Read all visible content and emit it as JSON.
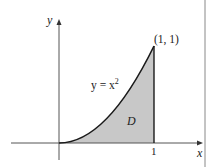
{
  "figure": {
    "curve_label_prefix": "y = x",
    "curve_label_exp": "2",
    "region_label": "D",
    "point_label": "(1, 1)",
    "x_axis_label": "x",
    "y_axis_label": "y",
    "x_tick_label": "1",
    "colors": {
      "region_fill": "#c8c8c8",
      "curve": "#1a1a1a",
      "axes": "#555555",
      "border": "#777777"
    }
  }
}
